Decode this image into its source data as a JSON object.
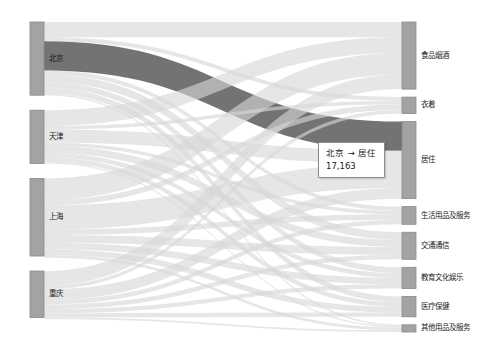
{
  "chart_data": {
    "type": "sankey",
    "title": "",
    "xlabel": "",
    "ylabel": "",
    "orientation": "horizontal",
    "colors": {
      "node": "#a3a3a3",
      "node_stroke": "#8a8a8a",
      "link": "#d6d6d6",
      "link_highlight": "#6b6b6b",
      "background": "#ffffff",
      "label_text": "#1b1b1b",
      "tooltip_border": "#8c8c8c",
      "tooltip_background": "#ffffff"
    },
    "source_nodes": [
      {
        "name": "北京",
        "total": 43038
      },
      {
        "name": "天津",
        "total": 31294
      },
      {
        "name": "上海",
        "total": 45605
      },
      {
        "name": "重庆",
        "total": 27388
      }
    ],
    "target_nodes": [
      {
        "name": "食品烟酒",
        "total": 39452
      },
      {
        "name": "衣着",
        "total": 9683
      },
      {
        "name": "居住",
        "total": 45310
      },
      {
        "name": "生活用品及服务",
        "total": 10366
      },
      {
        "name": "交通通信",
        "total": 15878
      },
      {
        "name": "教育文化娱乐",
        "total": 12443
      },
      {
        "name": "医疗保健",
        "total": 11974
      },
      {
        "name": "其他用品及服务",
        "total": 4219
      }
    ],
    "links": [
      {
        "source": "北京",
        "target": "食品烟酒",
        "value": 9021
      },
      {
        "source": "北京",
        "target": "衣着",
        "value": 2262
      },
      {
        "source": "北京",
        "target": "居住",
        "value": 17163
      },
      {
        "source": "北京",
        "target": "生活用品及服务",
        "value": 2447
      },
      {
        "source": "北京",
        "target": "交通通信",
        "value": 4514
      },
      {
        "source": "北京",
        "target": "教育文化娱乐",
        "value": 3445
      },
      {
        "source": "北京",
        "target": "医疗保健",
        "value": 3368
      },
      {
        "source": "北京",
        "target": "其他用品及服务",
        "value": 818
      },
      {
        "source": "天津",
        "target": "食品烟酒",
        "value": 9237
      },
      {
        "source": "天津",
        "target": "衣着",
        "value": 2133
      },
      {
        "source": "天津",
        "target": "居住",
        "value": 7570
      },
      {
        "source": "天津",
        "target": "生活用品及服务",
        "value": 2038
      },
      {
        "source": "天津",
        "target": "交通通信",
        "value": 4125
      },
      {
        "source": "天津",
        "target": "教育文化娱乐",
        "value": 2720
      },
      {
        "source": "天津",
        "target": "医疗保健",
        "value": 2766
      },
      {
        "source": "天津",
        "target": "其他用品及服务",
        "value": 705
      },
      {
        "source": "上海",
        "target": "食品烟酒",
        "value": 12584
      },
      {
        "source": "上海",
        "target": "衣着",
        "value": 3143
      },
      {
        "source": "上海",
        "target": "居住",
        "value": 14266
      },
      {
        "source": "上海",
        "target": "生活用品及服务",
        "value": 3223
      },
      {
        "source": "上海",
        "target": "交通通信",
        "value": 4584
      },
      {
        "source": "上海",
        "target": "教育文化娱乐",
        "value": 3837
      },
      {
        "source": "上海",
        "target": "医疗保健",
        "value": 3348
      },
      {
        "source": "上海",
        "target": "其他用品及服务",
        "value": 1620
      },
      {
        "source": "重庆",
        "target": "食品烟酒",
        "value": 8610
      },
      {
        "source": "重庆",
        "target": "衣着",
        "value": 2145
      },
      {
        "source": "重庆",
        "target": "居住",
        "value": 6311
      },
      {
        "source": "重庆",
        "target": "生活用品及服务",
        "value": 2658
      },
      {
        "source": "重庆",
        "target": "交通通信",
        "value": 2655
      },
      {
        "source": "重庆",
        "target": "教育文化娱乐",
        "value": 2441
      },
      {
        "source": "重庆",
        "target": "医疗保健",
        "value": 2492
      },
      {
        "source": "重庆",
        "target": "其他用品及服务",
        "value": 1076
      }
    ],
    "highlighted_link": {
      "source": "北京",
      "target": "居住",
      "value": 17163
    },
    "legend": "none",
    "grid": false
  },
  "tooltip": {
    "title": "北京 → 居住",
    "value": "17,163"
  },
  "labels": {
    "source": [
      "北京",
      "天津",
      "上海",
      "重庆"
    ],
    "target": [
      "食品烟酒",
      "衣着",
      "居住",
      "生活用品及服务",
      "交通通信",
      "教育文化娱乐",
      "医疗保健",
      "其他用品及服务"
    ]
  }
}
